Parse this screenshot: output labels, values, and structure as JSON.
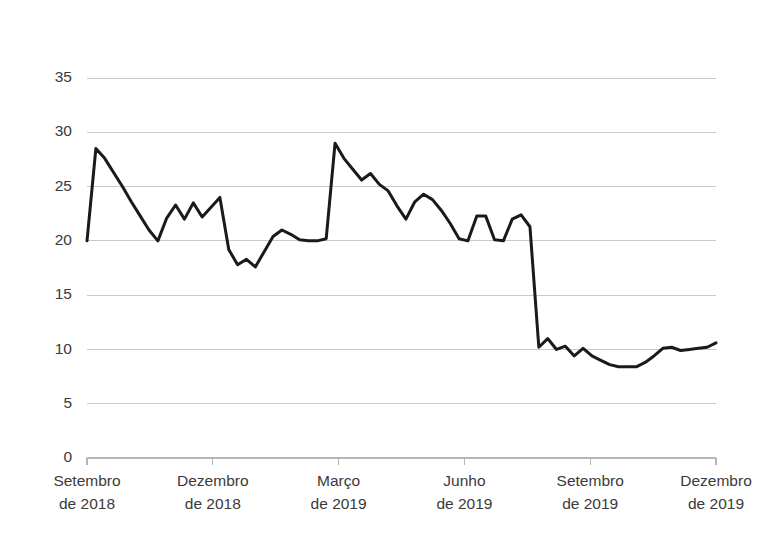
{
  "chart_data": {
    "type": "line",
    "title": "",
    "subtitle": "",
    "xlabel": "",
    "ylabel": "",
    "ylim": [
      0,
      35
    ],
    "yticks": [
      0,
      5,
      10,
      15,
      20,
      25,
      30,
      35
    ],
    "ytick_labels": [
      "0",
      "5",
      "10",
      "15",
      "20",
      "25",
      "30",
      "35"
    ],
    "grid": true,
    "grid_axis": "y",
    "legend": "none",
    "line_color": "#1a1a1a",
    "grid_color": "#c9c9c9",
    "axis_color": "#b5b5b5",
    "background_color": "#ffffff",
    "xtick_labels": [
      "Setembro\nde 2018",
      "Dezembro\nde 2018",
      "Março\nde 2019",
      "Junho\nde 2019",
      "Setembro\nde 2019",
      "Dezembro\nde 2019"
    ],
    "xtick_lines": [
      [
        "Setembro",
        "de 2018"
      ],
      [
        "Dezembro",
        "de 2018"
      ],
      [
        "Março",
        "de 2019"
      ],
      [
        "Junho",
        "de 2019"
      ],
      [
        "Setembro",
        "de 2019"
      ],
      [
        "Dezembro",
        "de 2019"
      ]
    ],
    "xtick_positions_frac": [
      0.0,
      0.2,
      0.4,
      0.6,
      0.8,
      1.0
    ],
    "x_start_label": "Setembro de 2018",
    "x_end_label": "Dezembro de 2019",
    "series": [
      {
        "name": "serie-1",
        "color": "#1a1a1a",
        "values": [
          20.0,
          28.5,
          27.6,
          26.3,
          25.0,
          23.6,
          22.3,
          21.0,
          20.0,
          22.1,
          23.3,
          22.0,
          23.5,
          22.2,
          23.1,
          24.0,
          19.2,
          17.8,
          18.3,
          17.6,
          19.0,
          20.4,
          21.0,
          20.6,
          20.1,
          20.0,
          20.0,
          20.2,
          29.0,
          27.6,
          26.6,
          25.6,
          26.2,
          25.2,
          24.6,
          23.2,
          22.0,
          23.6,
          24.3,
          23.8,
          22.8,
          21.6,
          20.2,
          20.0,
          22.3,
          22.3,
          20.1,
          20.0,
          22.0,
          22.4,
          21.3,
          10.2,
          11.0,
          10.0,
          10.3,
          9.4,
          10.1,
          9.4,
          9.0,
          8.6,
          8.4,
          8.4,
          8.4,
          8.8,
          9.4,
          10.1,
          10.2,
          9.9,
          10.0,
          10.1,
          10.2,
          10.6
        ]
      }
    ]
  },
  "axis": {
    "y_axis_name": "value-axis",
    "x_axis_name": "time-axis"
  }
}
